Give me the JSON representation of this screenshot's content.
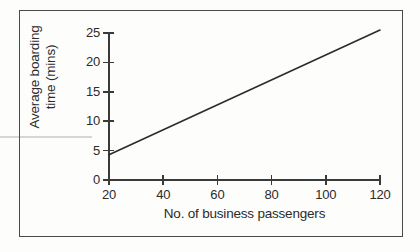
{
  "figure": {
    "background_color": "#fdfdfb",
    "frame_color": "#4a4a4a",
    "ink_color": "#3a3a3a"
  },
  "chart_data": {
    "type": "line",
    "title": "",
    "subtitle": "",
    "xlabel": "No. of business passengers",
    "ylabel": "Average boarding time (mins)",
    "ylabel_line1": "Average boarding",
    "ylabel_line2": "time (mins)",
    "xlim": [
      20,
      120
    ],
    "ylim": [
      0,
      25
    ],
    "xticks": [
      20,
      40,
      60,
      80,
      100,
      120
    ],
    "yticks": [
      0,
      5,
      10,
      15,
      20,
      25
    ],
    "xticklabels": [
      "20",
      "40",
      "60",
      "80",
      "100",
      "120"
    ],
    "yticklabels": [
      "0",
      "5",
      "10",
      "15",
      "20",
      "25"
    ],
    "grid": false,
    "legend": false,
    "legend_position": "none",
    "series": [
      {
        "name": "Average boarding time",
        "color": "#2b2b2b",
        "line_width": 1.6,
        "marker": "none",
        "x": [
          20,
          120
        ],
        "values": [
          4.3,
          25.5
        ],
        "points": [
          [
            20,
            4.3
          ],
          [
            120,
            25.5
          ]
        ],
        "slope_per_passenger": 0.212,
        "intercept_at_zero": 0.06
      }
    ],
    "annotations": []
  }
}
